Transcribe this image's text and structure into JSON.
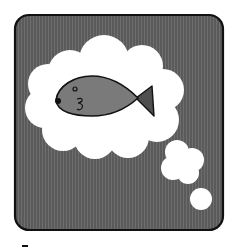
{
  "illustration": {
    "subject": "fish-thought-bubble",
    "description": "A gray fish inside a white thought cloud on a dark striped rounded-square background",
    "colors": {
      "page_background": "#ffffff",
      "frame_fill": "#5a5a5a",
      "frame_stripe": "#6e6e6e",
      "frame_outline": "#111111",
      "cloud_fill": "#ffffff",
      "fish_body": "#7a7a7a",
      "fish_tail": "#4f4f4f",
      "fish_outline": "#111111"
    }
  }
}
